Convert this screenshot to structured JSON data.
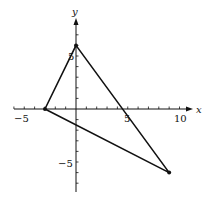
{
  "chart_data": {
    "type": "scatter",
    "title": "",
    "xlabel": "x",
    "ylabel": "y",
    "xlim": [
      -6,
      11
    ],
    "ylim": [
      -8.5,
      8.5
    ],
    "grid": false,
    "x_tick_labels": [
      "-5",
      "5",
      "10"
    ],
    "y_tick_labels": [
      "5",
      "-5"
    ],
    "series": [
      {
        "name": "triangle",
        "points": [
          {
            "x": -3,
            "y": 0
          },
          {
            "x": 0,
            "y": 6
          },
          {
            "x": 9,
            "y": -6
          }
        ],
        "closed": true
      }
    ]
  },
  "labels": {
    "x_axis": "x",
    "y_axis": "y",
    "x_neg5": "−5",
    "x_5": "5",
    "x_10": "10",
    "y_5": "5",
    "y_neg5": "−5"
  },
  "colors": {
    "stroke": "#111111",
    "background": "#ffffff"
  }
}
